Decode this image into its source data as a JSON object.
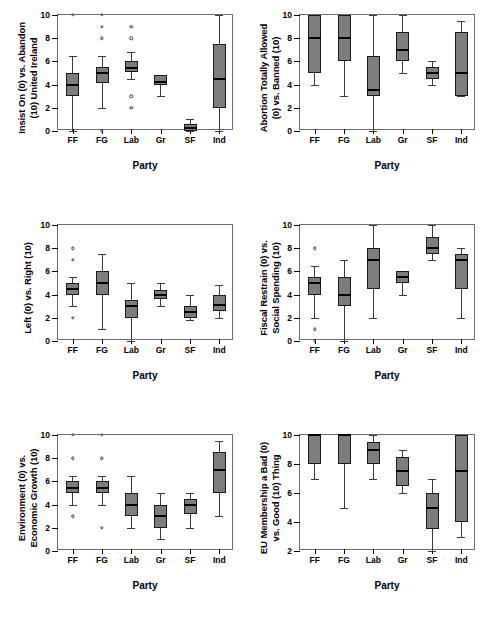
{
  "figure": {
    "xlabel": "Party",
    "categories": [
      "FF",
      "FG",
      "Lab",
      "Gr",
      "SF",
      "Ind"
    ],
    "caption": ""
  },
  "chart_data": [
    {
      "type": "box",
      "index": 0,
      "position": "top-left",
      "ylabel": "Insist On (0) vs. Abandon (10) United Ireland",
      "ylabel_lines": [
        "Insist On (0) vs. Abandon",
        "(10) United Ireland"
      ],
      "xlabel": "Party",
      "ylim": [
        0,
        10
      ],
      "yticks": [
        0,
        2,
        4,
        6,
        8,
        10
      ],
      "categories": [
        "FF",
        "FG",
        "Lab",
        "Gr",
        "SF",
        "Ind"
      ],
      "boxes": [
        {
          "category": "FF",
          "min": 0.0,
          "q1": 3.0,
          "median": 4.0,
          "q3": 5.0,
          "max": 6.5,
          "outliers": [
            10
          ]
        },
        {
          "category": "FG",
          "min": 2.0,
          "q1": 4.1,
          "median": 5.0,
          "q3": 5.5,
          "max": 6.5,
          "outliers": [
            10,
            9,
            8,
            0
          ]
        },
        {
          "category": "Lab",
          "min": 4.5,
          "q1": 5.1,
          "median": 5.4,
          "q3": 6.0,
          "max": 6.8,
          "outliers": [
            9,
            8,
            3,
            2
          ]
        },
        {
          "category": "Gr",
          "min": 3.0,
          "q1": 4.0,
          "median": 4.2,
          "q3": 4.8,
          "max": 4.8,
          "outliers": []
        },
        {
          "category": "SF",
          "min": 0.0,
          "q1": 0.0,
          "median": 0.3,
          "q3": 0.6,
          "max": 1.0,
          "outliers": []
        },
        {
          "category": "Ind",
          "min": 0.0,
          "q1": 2.0,
          "median": 4.5,
          "q3": 7.5,
          "max": 10.0,
          "outliers": []
        }
      ]
    },
    {
      "type": "box",
      "index": 1,
      "position": "top-right",
      "ylabel": "Abortion Totally Allowed (0) vs. Banned (10)",
      "ylabel_lines": [
        "Abortion Totally Allowed",
        "(0) vs. Banned (10)"
      ],
      "xlabel": "Party",
      "ylim": [
        0,
        10
      ],
      "yticks": [
        0,
        2,
        4,
        6,
        8,
        10
      ],
      "categories": [
        "FF",
        "FG",
        "Lab",
        "Gr",
        "SF",
        "Ind"
      ],
      "boxes": [
        {
          "category": "FF",
          "min": 4.0,
          "q1": 5.0,
          "median": 8.0,
          "q3": 10.0,
          "max": 10.0,
          "outliers": []
        },
        {
          "category": "FG",
          "min": 3.0,
          "q1": 6.0,
          "median": 8.0,
          "q3": 10.0,
          "max": 10.0,
          "outliers": []
        },
        {
          "category": "Lab",
          "min": 0.0,
          "q1": 3.0,
          "median": 3.5,
          "q3": 6.5,
          "max": 10.0,
          "outliers": []
        },
        {
          "category": "Gr",
          "min": 5.0,
          "q1": 6.0,
          "median": 7.0,
          "q3": 8.5,
          "max": 10.0,
          "outliers": []
        },
        {
          "category": "SF",
          "min": 4.0,
          "q1": 4.5,
          "median": 5.0,
          "q3": 5.5,
          "max": 6.0,
          "outliers": []
        },
        {
          "category": "Ind",
          "min": 3.0,
          "q1": 3.0,
          "median": 5.0,
          "q3": 8.5,
          "max": 9.5,
          "outliers": []
        }
      ]
    },
    {
      "type": "box",
      "index": 2,
      "position": "middle-left",
      "ylabel": "Left (0) vs. Right (10)",
      "ylabel_lines": [
        "Left (0) vs. Right (10)"
      ],
      "xlabel": "Party",
      "ylim": [
        0,
        10
      ],
      "yticks": [
        0,
        2,
        4,
        6,
        8,
        10
      ],
      "categories": [
        "FF",
        "FG",
        "Lab",
        "Gr",
        "SF",
        "Ind"
      ],
      "boxes": [
        {
          "category": "FF",
          "min": 3.0,
          "q1": 4.0,
          "median": 4.5,
          "q3": 5.0,
          "max": 5.5,
          "outliers": [
            8,
            7,
            2
          ]
        },
        {
          "category": "FG",
          "min": 1.0,
          "q1": 4.0,
          "median": 5.0,
          "q3": 6.0,
          "max": 7.5,
          "outliers": []
        },
        {
          "category": "Lab",
          "min": 0.0,
          "q1": 2.0,
          "median": 3.0,
          "q3": 3.5,
          "max": 5.0,
          "outliers": []
        },
        {
          "category": "Gr",
          "min": 3.0,
          "q1": 3.6,
          "median": 4.0,
          "q3": 4.4,
          "max": 5.0,
          "outliers": []
        },
        {
          "category": "SF",
          "min": 1.8,
          "q1": 2.0,
          "median": 2.5,
          "q3": 3.0,
          "max": 4.0,
          "outliers": []
        },
        {
          "category": "Ind",
          "min": 2.0,
          "q1": 2.6,
          "median": 3.1,
          "q3": 4.0,
          "max": 4.8,
          "outliers": []
        }
      ]
    },
    {
      "type": "box",
      "index": 3,
      "position": "middle-right",
      "ylabel": "Fiscal Restrain (0) vs. Social Spending (10)",
      "ylabel_lines": [
        "Fiscal Restrain (0) vs.",
        "Social Spending (10)"
      ],
      "xlabel": "Party",
      "ylim": [
        0,
        10
      ],
      "yticks": [
        0,
        2,
        4,
        6,
        8,
        10
      ],
      "categories": [
        "FF",
        "FG",
        "Lab",
        "Gr",
        "SF",
        "Ind"
      ],
      "boxes": [
        {
          "category": "FF",
          "min": 2.0,
          "q1": 4.0,
          "median": 5.0,
          "q3": 5.5,
          "max": 6.5,
          "outliers": [
            8,
            1,
            0
          ]
        },
        {
          "category": "FG",
          "min": 0.0,
          "q1": 3.0,
          "median": 4.0,
          "q3": 5.5,
          "max": 7.0,
          "outliers": []
        },
        {
          "category": "Lab",
          "min": 2.0,
          "q1": 4.5,
          "median": 7.0,
          "q3": 8.0,
          "max": 10.0,
          "outliers": []
        },
        {
          "category": "Gr",
          "min": 4.0,
          "q1": 5.0,
          "median": 5.5,
          "q3": 6.0,
          "max": 6.0,
          "outliers": []
        },
        {
          "category": "SF",
          "min": 7.0,
          "q1": 7.5,
          "median": 8.0,
          "q3": 9.0,
          "max": 10.0,
          "outliers": []
        },
        {
          "category": "Ind",
          "min": 2.0,
          "q1": 4.5,
          "median": 7.0,
          "q3": 7.5,
          "max": 8.0,
          "outliers": []
        }
      ]
    },
    {
      "type": "box",
      "index": 4,
      "position": "bottom-left",
      "ylabel": "Environment (0) vs. Economic Growth (10)",
      "ylabel_lines": [
        "Environment (0) vs.",
        "Economic Growth (10)"
      ],
      "xlabel": "Party",
      "ylim": [
        0,
        10
      ],
      "yticks": [
        0,
        2,
        4,
        6,
        8,
        10
      ],
      "categories": [
        "FF",
        "FG",
        "Lab",
        "Gr",
        "SF",
        "Ind"
      ],
      "boxes": [
        {
          "category": "FF",
          "min": 4.0,
          "q1": 5.0,
          "median": 5.4,
          "q3": 6.0,
          "max": 6.5,
          "outliers": [
            10,
            8,
            3
          ]
        },
        {
          "category": "FG",
          "min": 4.0,
          "q1": 5.0,
          "median": 5.4,
          "q3": 6.0,
          "max": 6.5,
          "outliers": [
            10,
            8,
            2
          ]
        },
        {
          "category": "Lab",
          "min": 2.0,
          "q1": 3.0,
          "median": 4.0,
          "q3": 5.0,
          "max": 6.5,
          "outliers": []
        },
        {
          "category": "Gr",
          "min": 1.0,
          "q1": 2.0,
          "median": 3.0,
          "q3": 4.0,
          "max": 5.0,
          "outliers": []
        },
        {
          "category": "SF",
          "min": 2.0,
          "q1": 3.2,
          "median": 4.0,
          "q3": 4.5,
          "max": 5.0,
          "outliers": []
        },
        {
          "category": "Ind",
          "min": 3.0,
          "q1": 5.0,
          "median": 7.0,
          "q3": 8.5,
          "max": 9.5,
          "outliers": []
        }
      ]
    },
    {
      "type": "box",
      "index": 5,
      "position": "bottom-right",
      "ylabel": "EU Membership a Bad (0) vs. Good (10) Thing",
      "ylabel_lines": [
        "EU Membership a Bad (0)",
        "vs. Good (10) Thing"
      ],
      "xlabel": "Party",
      "ylim": [
        2,
        10
      ],
      "yticks": [
        2,
        4,
        6,
        8,
        10
      ],
      "categories": [
        "FF",
        "FG",
        "Lab",
        "Gr",
        "SF",
        "Ind"
      ],
      "boxes": [
        {
          "category": "FF",
          "min": 7.0,
          "q1": 8.0,
          "median": 10.0,
          "q3": 10.0,
          "max": 10.0,
          "outliers": []
        },
        {
          "category": "FG",
          "min": 5.0,
          "q1": 8.0,
          "median": 10.0,
          "q3": 10.0,
          "max": 10.0,
          "outliers": []
        },
        {
          "category": "Lab",
          "min": 7.0,
          "q1": 8.0,
          "median": 9.0,
          "q3": 9.5,
          "max": 10.0,
          "outliers": []
        },
        {
          "category": "Gr",
          "min": 6.0,
          "q1": 6.5,
          "median": 7.5,
          "q3": 8.5,
          "max": 9.0,
          "outliers": []
        },
        {
          "category": "SF",
          "min": 2.0,
          "q1": 3.5,
          "median": 5.0,
          "q3": 6.0,
          "max": 7.0,
          "outliers": []
        },
        {
          "category": "Ind",
          "min": 3.0,
          "q1": 4.0,
          "median": 7.5,
          "q3": 10.0,
          "max": 10.0,
          "outliers": []
        }
      ]
    }
  ]
}
